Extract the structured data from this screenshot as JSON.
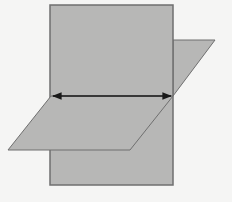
{
  "diagram": {
    "title": "",
    "colors": {
      "background": "#f5f5f4",
      "plane_fill": "#b7b7b6",
      "plane_stroke": "#6f6f6f",
      "line_stroke": "#1a1a1a"
    },
    "shapes": {
      "vertical_plane": {
        "type": "rectangle",
        "x": 50,
        "y": 5,
        "width": 123,
        "height": 180
      },
      "horizontal_plane": {
        "type": "parallelogram",
        "points": [
          [
            8,
            150
          ],
          [
            130,
            150
          ],
          [
            215,
            40
          ],
          [
            173,
            40
          ]
        ]
      },
      "intersection_line": {
        "type": "double-arrow",
        "x1": 51,
        "y1": 96,
        "x2": 172,
        "y2": 96
      }
    }
  }
}
